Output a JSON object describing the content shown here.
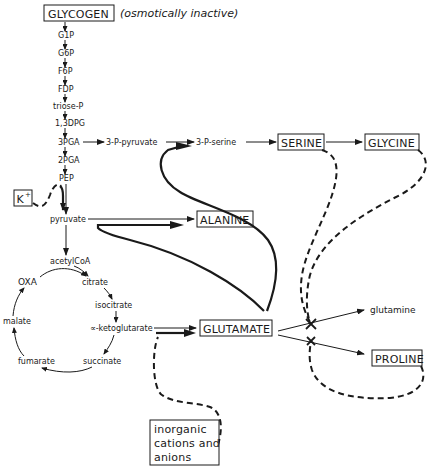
{
  "title": {
    "main_box": "GLYCOGEN",
    "annotation": "(osmotically inactive)"
  },
  "glycolysis": [
    "G1P",
    "G6P",
    "F6P",
    "FDP",
    "triose-P",
    "1,3DPG",
    "3PGA",
    "2PGA",
    "PEP",
    "pyruvate"
  ],
  "serine_branch": {
    "step1": "3-P-pyruvate",
    "step2": "3-P-serine",
    "serine": "SERINE",
    "glycine": "GLYCINE"
  },
  "effectors": {
    "potassium": "K",
    "potassium_sup": "+",
    "inorganic": [
      "inorganic",
      "cations and",
      "anions"
    ]
  },
  "products": {
    "alanine": "ALANINE",
    "glutamate": "GLUTAMATE",
    "glutamine": "glutamine",
    "proline": "PROLINE"
  },
  "tca_cycle": {
    "entry": "acetylCoA",
    "members": [
      "OXA",
      "citrate",
      "isocitrate",
      "∝-ketoglutarate",
      "succinate",
      "fumarate",
      "malate"
    ]
  },
  "colors": {
    "ink": "#1a1a1a",
    "background": "#ffffff"
  }
}
